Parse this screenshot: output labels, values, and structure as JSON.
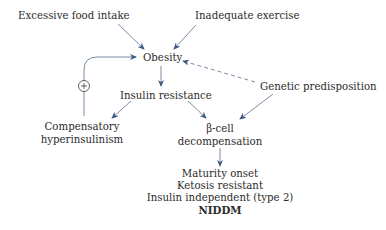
{
  "diagram": {
    "nodes": {
      "excessive_food": "Excessive food intake",
      "inadequate_exercise": "Inadequate exercise",
      "obesity": "Obesity",
      "insulin_resistance": "Insulin resistance",
      "genetic": "Genetic predisposition",
      "compensatory_line1": "Compensatory",
      "compensatory_line2": "hyperinsulinism",
      "beta_line1": "β-cell",
      "beta_line2": "decompensation",
      "outcome_line1": "Maturity onset",
      "outcome_line2": "Ketosis resistant",
      "outcome_line3": "Insulin independent (type 2)",
      "outcome_line4": "NIDDM"
    },
    "feedback_sign": "+",
    "colors": {
      "arrow": "#3d5a80",
      "loop": "#6b7f99",
      "text": "#2b2b2b"
    }
  }
}
